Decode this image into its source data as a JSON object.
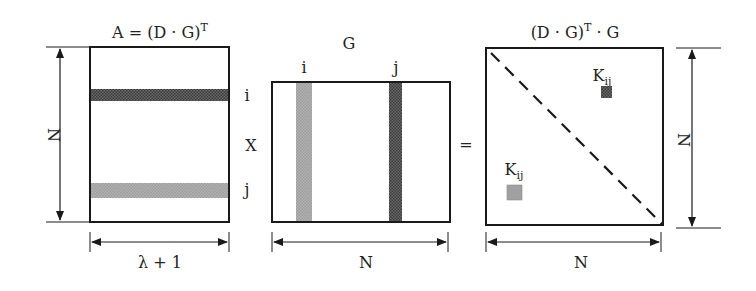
{
  "diagram": {
    "colors": {
      "stroke": "#1a1a1a",
      "dark_band": "#555555",
      "light_band": "#a8a8a8",
      "block_dark": "#707070",
      "block_light": "#a0a0a0",
      "background": "#ffffff"
    },
    "matrix_a": {
      "title_prefix": "A = (D · G)",
      "title_sup": "T",
      "row_label_i": "i",
      "row_label_j": "j",
      "height_label": "N",
      "width_label": "λ + 1"
    },
    "operator_times": "X",
    "matrix_g": {
      "title": "G",
      "col_label_i": "i",
      "col_label_j": "j",
      "width_label": "N"
    },
    "operator_equals": "=",
    "matrix_result": {
      "title_prefix": "(D · G)",
      "title_sup": "T",
      "title_suffix": " · G",
      "block_upper_label": "K",
      "block_upper_sub": "ij",
      "block_lower_label": "K",
      "block_lower_sub": "ij",
      "height_label": "N",
      "width_label": "N"
    }
  }
}
